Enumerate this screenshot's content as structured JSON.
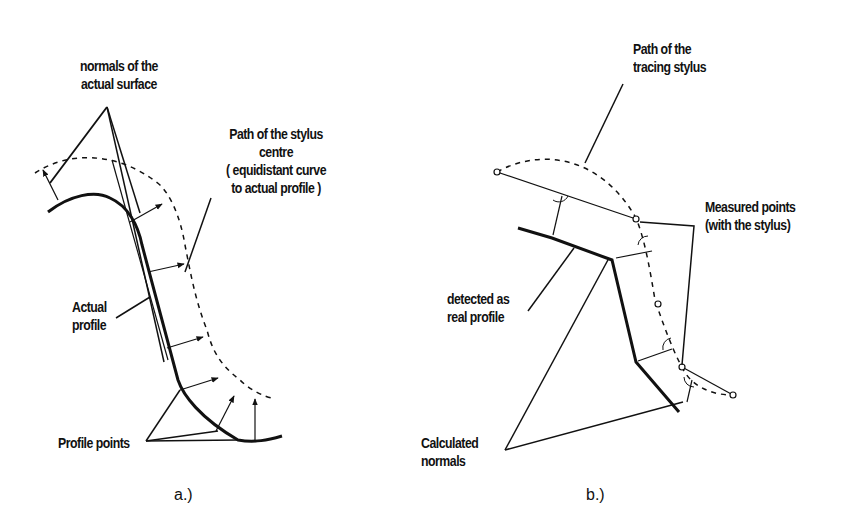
{
  "figure_a": {
    "caption": "a.)",
    "labels": {
      "normals_line1": "normals of the",
      "normals_line2": "actual surface",
      "path_line1": "Path of the stylus",
      "path_line2": "centre",
      "path_line3": "( equidistant curve",
      "path_line4": "to actual profile  )",
      "actual_line1": "Actual",
      "actual_line2": "profile",
      "profile_points": "Profile points"
    }
  },
  "figure_b": {
    "caption": "b.)",
    "labels": {
      "tracing_line1": "Path of the",
      "tracing_line2": "tracing stylus",
      "measured_line1": "Measured points",
      "measured_line2": "(with the stylus)",
      "detected_line1": "detected as",
      "detected_line2": "real profile",
      "calc_line1": "Calculated",
      "calc_line2": "normals"
    }
  },
  "colors": {
    "ink": "#111111",
    "background": "#ffffff"
  }
}
